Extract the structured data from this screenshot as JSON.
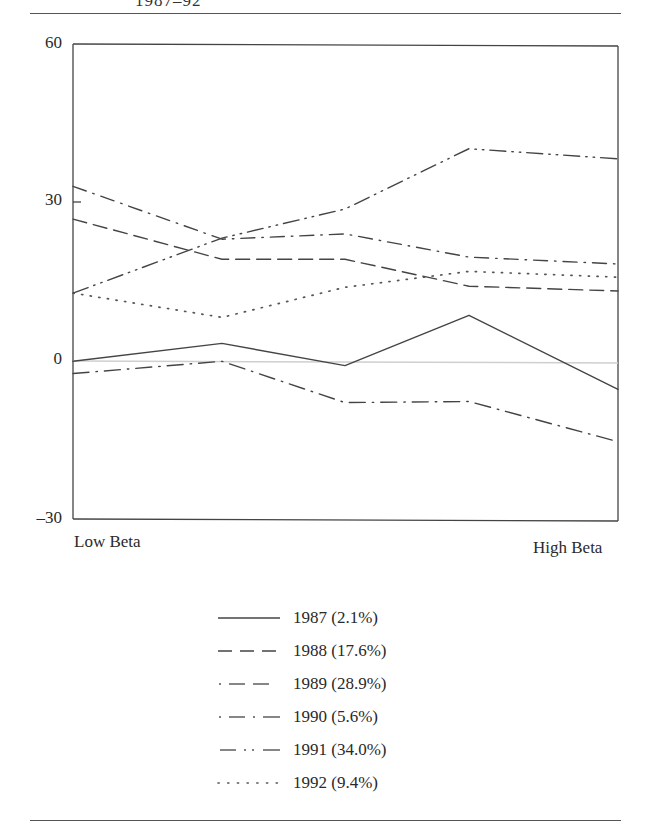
{
  "page": {
    "top_fragment": "1987–92"
  },
  "chart_data": {
    "type": "line",
    "title": "",
    "xlabel": "",
    "ylabel": "",
    "x_end_labels": {
      "left": "Low Beta",
      "right": "High Beta"
    },
    "x": [
      1,
      2,
      3,
      4,
      5
    ],
    "x_description": "Beta portfolios ordered from low beta (left) to high beta (right)",
    "ylim": [
      -30,
      60
    ],
    "yticks": [
      -30,
      0,
      30,
      60
    ],
    "ytick_labels": [
      "–30",
      "0",
      "30",
      "60"
    ],
    "zero_line": true,
    "grid": false,
    "legend_position": "below",
    "series": [
      {
        "name": "1987 (2.1%)",
        "year": "1987",
        "market_return": "2.1%",
        "style": "solid",
        "values": [
          0.0,
          3.4,
          -0.8,
          8.7,
          -5.3
        ]
      },
      {
        "name": "1988 (17.6%)",
        "year": "1988",
        "market_return": "17.6%",
        "style": "dashed",
        "values": [
          26.9,
          19.3,
          19.3,
          14.2,
          13.3
        ]
      },
      {
        "name": "1989 (28.9%)",
        "year": "1989",
        "market_return": "28.9%",
        "style": "dot-dash-dash",
        "values": [
          33.1,
          23.1,
          24.1,
          19.7,
          18.4
        ]
      },
      {
        "name": "1990 (5.6%)",
        "year": "1990",
        "market_return": "5.6%",
        "style": "dot-dash",
        "values": [
          -2.3,
          0.0,
          -7.8,
          -7.6,
          -15.2
        ]
      },
      {
        "name": "1991 (34.0%)",
        "year": "1991",
        "market_return": "34.0%",
        "style": "dash-dot-dot",
        "values": [
          12.9,
          23.3,
          28.8,
          40.2,
          38.3
        ]
      },
      {
        "name": "1992 (9.4%)",
        "year": "1992",
        "market_return": "9.4%",
        "style": "dotted",
        "values": [
          12.9,
          8.3,
          14.0,
          17.0,
          15.9
        ]
      }
    ]
  },
  "legend": [
    {
      "label": "1987 (2.1%)"
    },
    {
      "label": "1988 (17.6%)"
    },
    {
      "label": "1989 (28.9%)"
    },
    {
      "label": "1990 (5.6%)"
    },
    {
      "label": "1991 (34.0%)"
    },
    {
      "label": "1992 (9.4%)"
    }
  ]
}
